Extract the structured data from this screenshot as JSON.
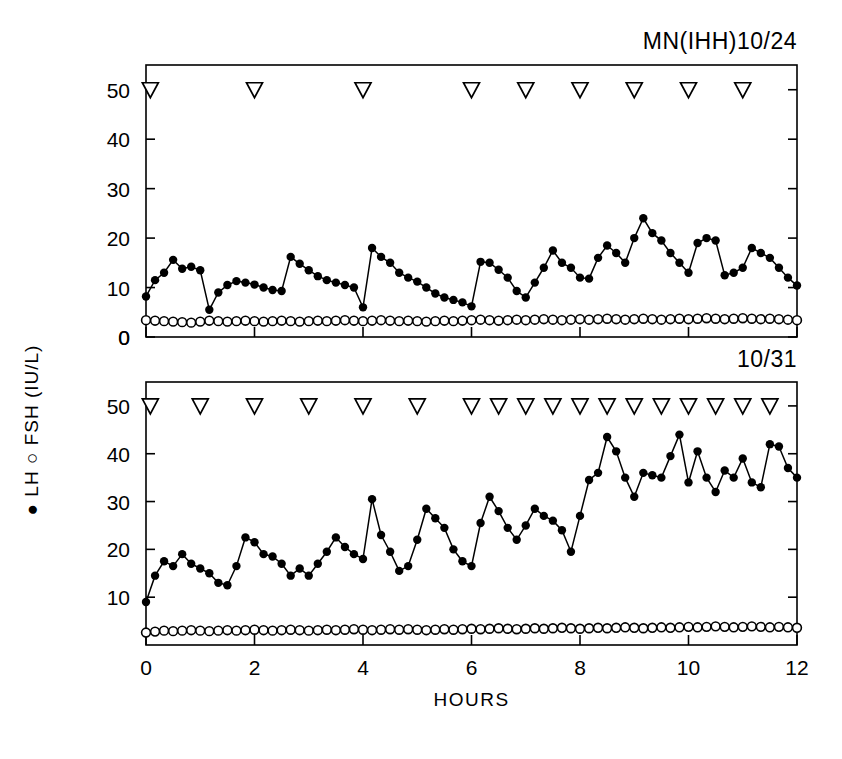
{
  "figure": {
    "panels": [
      {
        "id": "top",
        "title": "MN(IHH)10/24"
      },
      {
        "id": "bottom",
        "title": "10/31"
      }
    ],
    "y_axis_label_parts": [
      "LH",
      "FSH (IU/L)"
    ],
    "y_axis_label_full": "● LH ○ FSH (IU/L)",
    "x_axis_label": "HOURS",
    "marker_legend": {
      "lh_symbol": "●",
      "fsh_symbol": "○",
      "pulse_symbol": "▽"
    },
    "colors": {
      "ink": "#000000",
      "background": "#ffffff"
    }
  },
  "chart_data": [
    {
      "type": "line",
      "panel": "top",
      "title": "MN(IHH)10/24",
      "xlabel": "HOURS",
      "ylabel": "LH  FSH (IU/L)",
      "xlim": [
        0,
        12
      ],
      "ylim": [
        0,
        55
      ],
      "xticks": [
        0,
        2,
        4,
        6,
        8,
        10,
        12
      ],
      "yticks": [
        0,
        10,
        20,
        30,
        40,
        50
      ],
      "ytick_labels": [
        "0",
        "10",
        "20",
        "30",
        "40",
        "50"
      ],
      "grid": false,
      "legend": "none",
      "pulse_marker_y": 50,
      "pulse_markers_x": [
        0.08,
        2.0,
        4.0,
        6.0,
        7.0,
        8.0,
        9.0,
        10.0,
        11.0
      ],
      "series": [
        {
          "name": "LH",
          "marker": "filled-circle",
          "x": [
            0,
            0.167,
            0.333,
            0.5,
            0.667,
            0.833,
            1,
            1.167,
            1.333,
            1.5,
            1.667,
            1.833,
            2,
            2.167,
            2.333,
            2.5,
            2.667,
            2.833,
            3,
            3.167,
            3.333,
            3.5,
            3.667,
            3.833,
            4,
            4.167,
            4.333,
            4.5,
            4.667,
            4.833,
            5,
            5.167,
            5.333,
            5.5,
            5.667,
            5.833,
            6,
            6.167,
            6.333,
            6.5,
            6.667,
            6.833,
            7,
            7.167,
            7.333,
            7.5,
            7.667,
            7.833,
            8,
            8.167,
            8.333,
            8.5,
            8.667,
            8.833,
            9,
            9.167,
            9.333,
            9.5,
            9.667,
            9.833,
            10,
            10.167,
            10.333,
            10.5,
            10.667,
            10.833,
            11,
            11.167,
            11.333,
            11.5,
            11.667,
            11.833,
            12
          ],
          "values": [
            8.2,
            11.5,
            13.0,
            15.6,
            13.8,
            14.2,
            13.5,
            5.5,
            9.0,
            10.5,
            11.3,
            11.0,
            10.6,
            10.0,
            9.5,
            9.3,
            16.2,
            14.8,
            13.5,
            12.3,
            11.5,
            11.0,
            10.5,
            10.0,
            6.0,
            18.0,
            16.2,
            15.0,
            13.0,
            12.0,
            11.2,
            10.0,
            8.8,
            8.0,
            7.5,
            7.0,
            6.2,
            15.2,
            15.0,
            13.6,
            12.0,
            9.3,
            8.0,
            11.0,
            14.0,
            17.5,
            15.0,
            14.0,
            12.0,
            11.8,
            16.0,
            18.5,
            17.0,
            15.0,
            20.0,
            24.0,
            21.0,
            19.5,
            17.0,
            15.0,
            13.0,
            19.0,
            20.0,
            19.5,
            12.5,
            13.0,
            14.0,
            18.0,
            17.0,
            16.0,
            14.0,
            12.0,
            10.4
          ]
        },
        {
          "name": "FSH",
          "marker": "open-circle",
          "x": [
            0,
            0.167,
            0.333,
            0.5,
            0.667,
            0.833,
            1,
            1.167,
            1.333,
            1.5,
            1.667,
            1.833,
            2,
            2.167,
            2.333,
            2.5,
            2.667,
            2.833,
            3,
            3.167,
            3.333,
            3.5,
            3.667,
            3.833,
            4,
            4.167,
            4.333,
            4.5,
            4.667,
            4.833,
            5,
            5.167,
            5.333,
            5.5,
            5.667,
            5.833,
            6,
            6.167,
            6.333,
            6.5,
            6.667,
            6.833,
            7,
            7.167,
            7.333,
            7.5,
            7.667,
            7.833,
            8,
            8.167,
            8.333,
            8.5,
            8.667,
            8.833,
            9,
            9.167,
            9.333,
            9.5,
            9.667,
            9.833,
            10,
            10.167,
            10.333,
            10.5,
            10.667,
            10.833,
            11,
            11.167,
            11.333,
            11.5,
            11.667,
            11.833,
            12
          ],
          "values": [
            3.4,
            3.3,
            3.2,
            3.1,
            3.0,
            2.9,
            3.1,
            3.3,
            3.2,
            3.1,
            3.2,
            3.3,
            3.2,
            3.1,
            3.2,
            3.3,
            3.2,
            3.1,
            3.2,
            3.3,
            3.2,
            3.3,
            3.4,
            3.3,
            3.2,
            3.3,
            3.4,
            3.3,
            3.2,
            3.3,
            3.2,
            3.1,
            3.2,
            3.3,
            3.2,
            3.3,
            3.4,
            3.5,
            3.4,
            3.3,
            3.4,
            3.5,
            3.4,
            3.5,
            3.6,
            3.5,
            3.4,
            3.5,
            3.6,
            3.5,
            3.6,
            3.7,
            3.6,
            3.5,
            3.6,
            3.7,
            3.6,
            3.5,
            3.6,
            3.7,
            3.6,
            3.7,
            3.8,
            3.7,
            3.6,
            3.7,
            3.8,
            3.7,
            3.6,
            3.7,
            3.6,
            3.5,
            3.4
          ]
        }
      ]
    },
    {
      "type": "line",
      "panel": "bottom",
      "title": "10/31",
      "xlabel": "HOURS",
      "ylabel": "LH  FSH (IU/L)",
      "xlim": [
        0,
        12
      ],
      "ylim": [
        0,
        55
      ],
      "xticks": [
        0,
        2,
        4,
        6,
        8,
        10,
        12
      ],
      "yticks": [
        10,
        20,
        30,
        40,
        50
      ],
      "ytick_labels": [
        "10",
        "20",
        "30",
        "40",
        "50"
      ],
      "grid": false,
      "legend": "none",
      "pulse_marker_y": 50,
      "pulse_markers_x": [
        0.08,
        1.0,
        2.0,
        3.0,
        4.0,
        5.0,
        6.0,
        6.5,
        7.0,
        7.5,
        8.0,
        8.5,
        9.0,
        9.5,
        10.0,
        10.5,
        11.0,
        11.5
      ],
      "series": [
        {
          "name": "LH",
          "marker": "filled-circle",
          "x": [
            0,
            0.167,
            0.333,
            0.5,
            0.667,
            0.833,
            1,
            1.167,
            1.333,
            1.5,
            1.667,
            1.833,
            2,
            2.167,
            2.333,
            2.5,
            2.667,
            2.833,
            3,
            3.167,
            3.333,
            3.5,
            3.667,
            3.833,
            4,
            4.167,
            4.333,
            4.5,
            4.667,
            4.833,
            5,
            5.167,
            5.333,
            5.5,
            5.667,
            5.833,
            6,
            6.167,
            6.333,
            6.5,
            6.667,
            6.833,
            7,
            7.167,
            7.333,
            7.5,
            7.667,
            7.833,
            8,
            8.167,
            8.333,
            8.5,
            8.667,
            8.833,
            9,
            9.167,
            9.333,
            9.5,
            9.667,
            9.833,
            10,
            10.167,
            10.333,
            10.5,
            10.667,
            10.833,
            11,
            11.167,
            11.333,
            11.5,
            11.667,
            11.833,
            12
          ],
          "values": [
            9.0,
            14.5,
            17.5,
            16.5,
            19.0,
            17.0,
            16.0,
            15.0,
            13.0,
            12.5,
            16.5,
            22.5,
            21.5,
            19.0,
            18.5,
            17.0,
            14.5,
            16.0,
            14.5,
            17.0,
            19.5,
            22.5,
            20.5,
            19.0,
            18.0,
            30.5,
            23.0,
            19.5,
            15.5,
            16.5,
            22.0,
            28.5,
            26.5,
            24.5,
            20.0,
            17.5,
            16.5,
            25.5,
            31.0,
            28.0,
            24.5,
            22.0,
            25.0,
            28.5,
            27.0,
            26.0,
            24.0,
            19.5,
            27.0,
            34.5,
            36.0,
            43.5,
            40.5,
            35.0,
            31.0,
            36.0,
            35.5,
            35.0,
            39.5,
            44.0,
            34.0,
            40.5,
            35.0,
            32.0,
            36.5,
            35.0,
            39.0,
            34.0,
            33.0,
            42.0,
            41.5,
            37.0,
            35.0
          ]
        },
        {
          "name": "FSH",
          "marker": "open-circle",
          "x": [
            0,
            0.167,
            0.333,
            0.5,
            0.667,
            0.833,
            1,
            1.167,
            1.333,
            1.5,
            1.667,
            1.833,
            2,
            2.167,
            2.333,
            2.5,
            2.667,
            2.833,
            3,
            3.167,
            3.333,
            3.5,
            3.667,
            3.833,
            4,
            4.167,
            4.333,
            4.5,
            4.667,
            4.833,
            5,
            5.167,
            5.333,
            5.5,
            5.667,
            5.833,
            6,
            6.167,
            6.333,
            6.5,
            6.667,
            6.833,
            7,
            7.167,
            7.333,
            7.5,
            7.667,
            7.833,
            8,
            8.167,
            8.333,
            8.5,
            8.667,
            8.833,
            9,
            9.167,
            9.333,
            9.5,
            9.667,
            9.833,
            10,
            10.167,
            10.333,
            10.5,
            10.667,
            10.833,
            11,
            11.167,
            11.333,
            11.5,
            11.667,
            11.833,
            12
          ],
          "values": [
            2.6,
            2.8,
            3.0,
            2.9,
            3.0,
            3.1,
            3.0,
            2.9,
            3.0,
            3.1,
            3.0,
            3.1,
            3.2,
            3.1,
            3.0,
            3.1,
            3.2,
            3.1,
            3.0,
            3.1,
            3.2,
            3.1,
            3.2,
            3.3,
            3.2,
            3.1,
            3.2,
            3.3,
            3.2,
            3.3,
            3.2,
            3.1,
            3.2,
            3.3,
            3.2,
            3.3,
            3.4,
            3.3,
            3.4,
            3.5,
            3.4,
            3.3,
            3.4,
            3.5,
            3.4,
            3.5,
            3.6,
            3.5,
            3.4,
            3.5,
            3.6,
            3.5,
            3.6,
            3.7,
            3.6,
            3.5,
            3.6,
            3.7,
            3.6,
            3.7,
            3.8,
            3.7,
            3.8,
            3.9,
            3.8,
            3.7,
            3.8,
            3.9,
            3.8,
            3.7,
            3.8,
            3.7,
            3.6
          ]
        }
      ]
    }
  ]
}
